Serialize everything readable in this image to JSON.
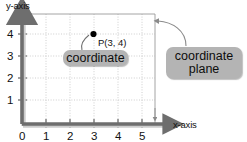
{
  "diagram": {
    "title_text_visible": false,
    "axes": {
      "x_axis_label": "x-axis",
      "y_axis_label": "y-axis",
      "x_ticks": [
        "0",
        "1",
        "2",
        "3",
        "4",
        "5"
      ],
      "y_ticks": [
        "1",
        "2",
        "3",
        "4"
      ],
      "origin_label": "0"
    },
    "point": {
      "label": "P(3, 4)",
      "x_value": 3,
      "y_value": 4
    },
    "callouts": [
      {
        "name": "coordinate",
        "text": "coordinate"
      },
      {
        "name": "coordinate-plane",
        "line1": "coordinate",
        "line2": "plane"
      }
    ],
    "colors": {
      "axis": "#6e6e6e",
      "grid": "#bfbfbf",
      "callout_fill": "#b4b4b4",
      "text": "#111111",
      "point": "#000000",
      "background": "#ffffff"
    }
  }
}
